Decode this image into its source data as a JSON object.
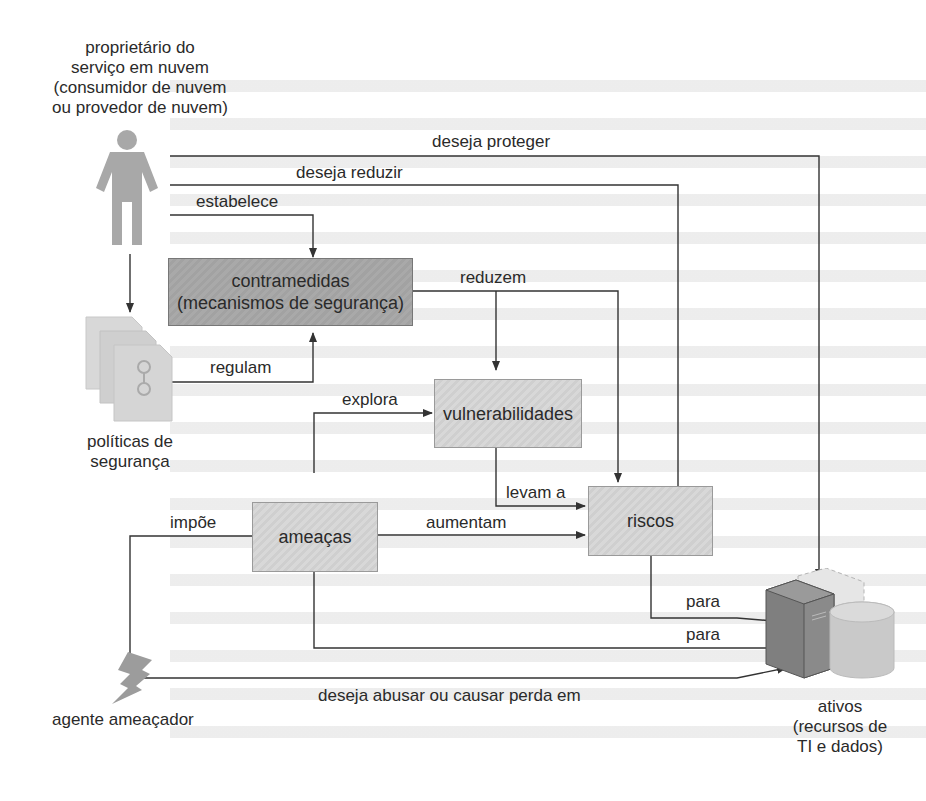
{
  "diagram": {
    "owner": {
      "label_lines": [
        "proprietário do",
        "serviço em nuvem",
        "(consumidor de nuvem",
        "ou provedor de nuvem)"
      ],
      "icon": "person-icon"
    },
    "policies": {
      "label_lines": [
        "políticas de",
        "segurança"
      ],
      "icon": "documents-icon"
    },
    "threat_agent": {
      "label": "agente ameaçador",
      "icon": "lightning-icon"
    },
    "assets": {
      "label_lines": [
        "ativos",
        "(recursos de",
        "TI e dados)"
      ],
      "icon": "server-database-icon"
    },
    "boxes": {
      "countermeasures": [
        "contramedidas",
        "(mecanismos de segurança)"
      ],
      "vulnerabilities": "vulnerabilidades",
      "risks": "riscos",
      "threats": "ameaças"
    },
    "edges": {
      "wants_to_protect": "deseja proteger",
      "wants_to_reduce": "deseja reduzir",
      "establishes": "estabelece",
      "reduce": "reduzem",
      "regulate": "regulam",
      "exploits": "explora",
      "lead_to": "levam a",
      "impose": "impõe",
      "increase": "aumentam",
      "to_1": "para",
      "to_2": "para",
      "wants_to_abuse": "deseja abusar ou causar perda em"
    },
    "colors": {
      "line": "#333333",
      "box_light": "#d4d4d4",
      "box_dark": "#a6a6a6"
    }
  }
}
